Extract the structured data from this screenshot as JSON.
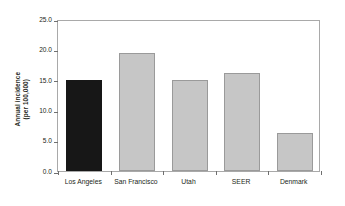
{
  "chart_data": {
    "type": "bar",
    "title": "",
    "xlabel": "",
    "ylabel": "Annual incidence\n(per 100,000)",
    "ylabel_line1": "Annual incidence",
    "ylabel_line2": "(per 100,000)",
    "categories": [
      "Los Angeles",
      "San Francisco",
      "Utah",
      "SEER",
      "Denmark"
    ],
    "values": [
      14.9,
      19.4,
      14.9,
      16.2,
      6.3
    ],
    "ylim": [
      0.0,
      25.0
    ],
    "yticks": [
      "0.0",
      "5.0",
      "10.0",
      "15.0",
      "20.0",
      "25.0"
    ],
    "ytick_values": [
      0.0,
      5.0,
      10.0,
      15.0,
      20.0,
      25.0
    ],
    "grid": false,
    "legend": "none",
    "bar_colors": [
      "#171717",
      "#c6c6c6",
      "#c6c6c6",
      "#c6c6c6",
      "#c6c6c6"
    ],
    "highlight_category": "Los Angeles",
    "frame_color": "#a9a9a9",
    "text_color": "#231f20"
  }
}
